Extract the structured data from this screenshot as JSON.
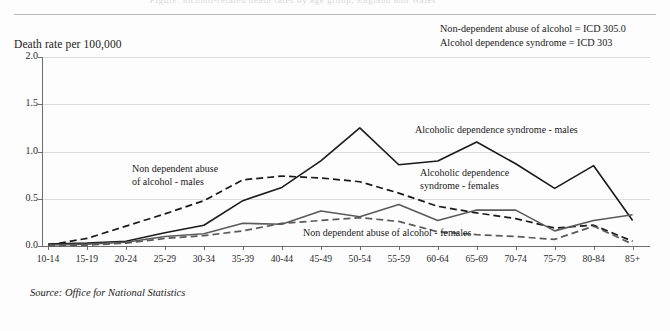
{
  "header": {
    "clipped_top_text": "Figure: alcohol-related death rates by age group, England and Wales",
    "y_axis_caption": "Death rate per 100,000"
  },
  "legend": {
    "lines": [
      "Non-dependent abuse of alcohol = ICD 305.0",
      "Alcohol dependence syndrome = ICD 303"
    ]
  },
  "annotations": {
    "male_nondependent": "Non dependent abuse\nof alcohol - males",
    "male_nondependent_l1": "Non dependent abuse",
    "male_nondependent_l2": "of alcohol - males",
    "male_dependence": "Alcoholic dependence syndrome - males",
    "female_dependence_l1": "Alcoholic dependence",
    "female_dependence_l2": "syndrome - females",
    "female_nondependent": "Non dependent abuse of alcohol - females"
  },
  "source": "Source: Office for National Statistics",
  "colors": {
    "male_dependence": "#1a1a1a",
    "male_nondependent": "#1a1a1a",
    "female_dependence": "#5a5a5a",
    "female_nondependent": "#5a5a5a",
    "grid": "#dcdcdc",
    "axis": "#6d6d6d",
    "background": "#fdfdfd"
  },
  "chart_data": {
    "type": "line",
    "title": "",
    "xlabel": "",
    "ylabel": "Death rate per 100,000",
    "ylim": [
      0.0,
      2.0
    ],
    "yticks": [
      0.0,
      0.5,
      1.0,
      1.5,
      2.0
    ],
    "ytick_labels": [
      "0.0",
      "0.5",
      "1.0",
      "1.5",
      "2.0"
    ],
    "grid": true,
    "legend_position": "in-plot annotations",
    "categories": [
      "10-14",
      "15-19",
      "20-24",
      "25-29",
      "30-34",
      "35-39",
      "40-44",
      "45-49",
      "50-54",
      "55-59",
      "60-64",
      "65-69",
      "70-74",
      "75-79",
      "80-84",
      "85+"
    ],
    "series": [
      {
        "name": "Alcoholic dependence syndrome - males",
        "style": "solid",
        "color": "#1a1a1a",
        "values": [
          0.02,
          0.03,
          0.05,
          0.14,
          0.22,
          0.48,
          0.62,
          0.9,
          1.25,
          0.86,
          0.9,
          1.1,
          0.87,
          0.61,
          0.85,
          0.27
        ]
      },
      {
        "name": "Non dependent abuse of alcohol - males",
        "style": "dashed",
        "color": "#1a1a1a",
        "values": [
          0.01,
          0.08,
          0.21,
          0.34,
          0.48,
          0.7,
          0.74,
          0.72,
          0.68,
          0.56,
          0.42,
          0.35,
          0.29,
          0.19,
          0.22,
          0.05
        ]
      },
      {
        "name": "Alcoholic dependence syndrome - females",
        "style": "solid",
        "color": "#5a5a5a",
        "values": [
          0.01,
          0.02,
          0.04,
          0.1,
          0.13,
          0.24,
          0.23,
          0.37,
          0.31,
          0.44,
          0.27,
          0.38,
          0.38,
          0.16,
          0.27,
          0.33
        ]
      },
      {
        "name": "Non dependent abuse of alcohol - females",
        "style": "dashed",
        "color": "#5a5a5a",
        "values": [
          0.0,
          0.01,
          0.03,
          0.08,
          0.11,
          0.16,
          0.24,
          0.27,
          0.3,
          0.26,
          0.15,
          0.12,
          0.1,
          0.07,
          0.21,
          0.02
        ]
      }
    ]
  }
}
